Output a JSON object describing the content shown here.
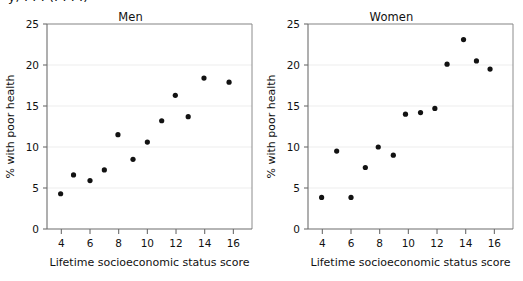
{
  "figure": {
    "partial_top_text": "y,  . . .  (. . . .)",
    "panel_count": 2
  },
  "axes": {
    "xlabel": "Lifetime socioeconomic status score",
    "ylabel": "% with poor health",
    "xticks": [
      "4",
      "6",
      "8",
      "10",
      "12",
      "14",
      "16"
    ],
    "yticks": [
      "0",
      "5",
      "10",
      "15",
      "20",
      "25"
    ]
  },
  "chart_data": [
    {
      "type": "scatter",
      "title": "Men",
      "xlabel": "Lifetime socioeconomic status score",
      "ylabel": "% with poor health",
      "xlim": [
        3.0,
        17.3
      ],
      "ylim": [
        0,
        25
      ],
      "xticks": [
        4,
        6,
        8,
        10,
        12,
        14,
        16
      ],
      "yticks": [
        0,
        5,
        10,
        15,
        20,
        25
      ],
      "grid": "horizontal",
      "marker": "filled-circle",
      "marker_color": "#121212",
      "points": [
        {
          "x": 3.95,
          "y": 4.3
        },
        {
          "x": 4.85,
          "y": 6.6
        },
        {
          "x": 6.0,
          "y": 5.9
        },
        {
          "x": 7.0,
          "y": 7.2
        },
        {
          "x": 7.95,
          "y": 11.5
        },
        {
          "x": 9.0,
          "y": 8.5
        },
        {
          "x": 10.0,
          "y": 10.6
        },
        {
          "x": 11.0,
          "y": 13.2
        },
        {
          "x": 11.95,
          "y": 16.3
        },
        {
          "x": 12.85,
          "y": 13.7
        },
        {
          "x": 13.95,
          "y": 18.4
        },
        {
          "x": 15.7,
          "y": 17.9
        }
      ]
    },
    {
      "type": "scatter",
      "title": "Women",
      "xlabel": "Lifetime socioeconomic status score",
      "ylabel": "% with poor health",
      "xlim": [
        3.0,
        17.3
      ],
      "ylim": [
        0,
        25
      ],
      "xticks": [
        4,
        6,
        8,
        10,
        12,
        14,
        16
      ],
      "yticks": [
        0,
        5,
        10,
        15,
        20,
        25
      ],
      "grid": "horizontal",
      "marker": "filled-circle",
      "marker_color": "#121212",
      "points": [
        {
          "x": 3.95,
          "y": 3.85
        },
        {
          "x": 5.0,
          "y": 9.5
        },
        {
          "x": 6.0,
          "y": 3.85
        },
        {
          "x": 7.0,
          "y": 7.5
        },
        {
          "x": 7.9,
          "y": 10.0
        },
        {
          "x": 8.95,
          "y": 9.0
        },
        {
          "x": 9.8,
          "y": 14.0
        },
        {
          "x": 10.85,
          "y": 14.2
        },
        {
          "x": 11.85,
          "y": 14.7
        },
        {
          "x": 12.7,
          "y": 20.1
        },
        {
          "x": 13.85,
          "y": 23.1
        },
        {
          "x": 14.75,
          "y": 20.5
        },
        {
          "x": 15.7,
          "y": 19.5
        }
      ]
    }
  ]
}
